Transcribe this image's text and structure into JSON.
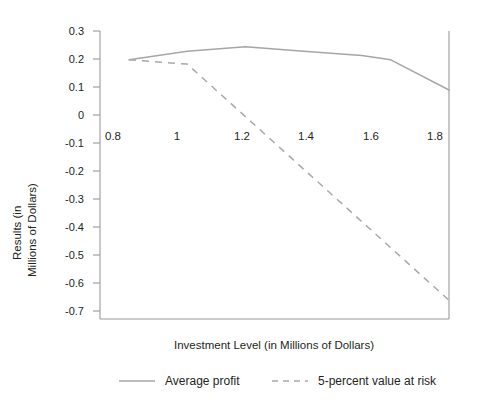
{
  "chart_data": {
    "type": "line",
    "title": "",
    "subtitle": "",
    "xlabel": "Investment Level (in Millions of Dollars)",
    "ylabel_line1": "Results (in",
    "ylabel_line2": "Millions of Dollars)",
    "ylabel": "Results (in Millions of Dollars)",
    "xlim": [
      0.7,
      1.9
    ],
    "ylim": [
      -0.7,
      0.3
    ],
    "grid": false,
    "legend_position": "bottom",
    "x_ticks": [
      0.8,
      1,
      1.2,
      1.4,
      1.6,
      1.8
    ],
    "x_tick_labels": [
      "0.8",
      "1",
      "1.2",
      "1.4",
      "1.6",
      "1.8"
    ],
    "y_ticks": [
      0.3,
      0.2,
      0.1,
      0,
      -0.1,
      -0.2,
      -0.3,
      -0.4,
      -0.5,
      -0.6,
      -0.7
    ],
    "y_tick_labels": [
      "0.3",
      "0.2",
      "0.1",
      "0",
      "-0.1",
      "-0.2",
      "-0.3",
      "-0.4",
      "-0.5",
      "-0.6",
      "-0.7"
    ],
    "x": [
      0.8,
      1.0,
      1.2,
      1.4,
      1.6,
      1.7,
      1.9
    ],
    "series": [
      {
        "name": "Average profit",
        "style": "solid",
        "color": "#a6a6a6",
        "x": [
          0.8,
          1.0,
          1.2,
          1.4,
          1.6,
          1.7,
          1.9
        ],
        "values": [
          0.2,
          0.23,
          0.245,
          0.23,
          0.215,
          0.2,
          0.095
        ]
      },
      {
        "name": "5-percent value at risk",
        "style": "dashed",
        "color": "#a9a9a9",
        "x": [
          0.8,
          1.0,
          1.9
        ],
        "values": [
          0.2,
          0.185,
          -0.635
        ]
      }
    ],
    "legend": [
      {
        "label": "Average profit",
        "style": "solid",
        "color": "#a6a6a6"
      },
      {
        "label": "5-percent value at risk",
        "style": "dashed",
        "color": "#a9a9a9"
      }
    ],
    "annotations": [],
    "axis_color": "#9a9a9a"
  }
}
